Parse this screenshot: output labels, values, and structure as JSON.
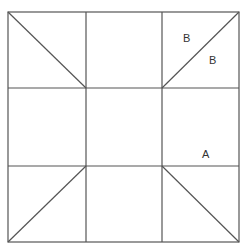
{
  "diagram": {
    "grid": {
      "left": 8,
      "top": 12,
      "right": 239,
      "bottom": 242,
      "v_lines": [
        86,
        162
      ],
      "h_lines": [
        88,
        166
      ]
    },
    "diagonals": [
      {
        "cell": "top-left",
        "from": [
          8,
          12
        ],
        "to": [
          86,
          88
        ]
      },
      {
        "cell": "top-right",
        "from": [
          162,
          88
        ],
        "to": [
          239,
          12
        ]
      },
      {
        "cell": "bottom-left",
        "from": [
          8,
          242
        ],
        "to": [
          86,
          166
        ]
      },
      {
        "cell": "bottom-right",
        "from": [
          162,
          166
        ],
        "to": [
          239,
          242
        ]
      }
    ],
    "labels": [
      {
        "text": "B",
        "x": 183,
        "y": 42
      },
      {
        "text": "B",
        "x": 209,
        "y": 64
      },
      {
        "text": "A",
        "x": 202,
        "y": 158
      }
    ],
    "line_color": "#555555"
  }
}
